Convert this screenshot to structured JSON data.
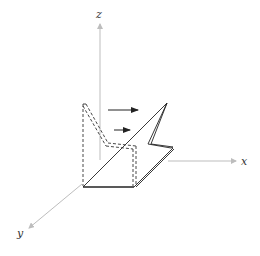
{
  "diagram": {
    "type": "3d-coordinate-sketch",
    "axes": {
      "x": {
        "label": "x"
      },
      "y": {
        "label": "y"
      },
      "z": {
        "label": "z"
      }
    },
    "colors": {
      "axis": "#bdbdbd",
      "stroke": "#222222",
      "dashed": "#333333"
    },
    "elements": [
      {
        "name": "folded-plate",
        "style": "solid"
      },
      {
        "name": "original-plate-position",
        "style": "dashed"
      },
      {
        "name": "flow-arrows",
        "count": 2
      }
    ]
  }
}
